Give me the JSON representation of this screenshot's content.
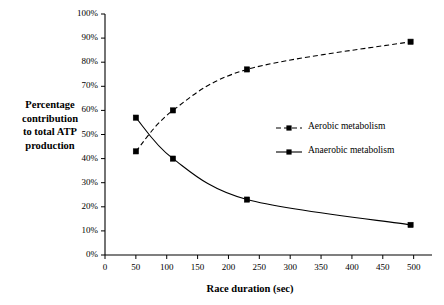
{
  "chart_data": {
    "type": "line",
    "title": "",
    "xlabel": "Race duration (sec)",
    "ylabel": "Percentage contribution to total ATP production",
    "xlim": [
      0,
      520
    ],
    "ylim": [
      0,
      100
    ],
    "grid": false,
    "legend_position": "center-right",
    "x_ticks": [
      "0",
      "50",
      "100",
      "150",
      "200",
      "250",
      "300",
      "350",
      "400",
      "450",
      "500"
    ],
    "x_tick_values": [
      0,
      50,
      100,
      150,
      200,
      250,
      300,
      350,
      400,
      450,
      500
    ],
    "y_ticks": [
      "0%",
      "10%",
      "20%",
      "30%",
      "40%",
      "50%",
      "60%",
      "70%",
      "80%",
      "90%",
      "100%"
    ],
    "y_tick_values": [
      0,
      10,
      20,
      30,
      40,
      50,
      60,
      70,
      80,
      90,
      100
    ],
    "series": [
      {
        "name": "Aerobic metabolism",
        "style": "dashed",
        "marker": "square",
        "color": "#000000",
        "x": [
          50,
          110,
          230,
          495
        ],
        "values": [
          43,
          60,
          77,
          88.5
        ]
      },
      {
        "name": "Anaerobic metabolism",
        "style": "solid",
        "marker": "square",
        "color": "#000000",
        "x": [
          50,
          110,
          230,
          495
        ],
        "values": [
          57,
          40,
          23,
          12.5
        ]
      }
    ]
  },
  "axis": {
    "y_label_lines": [
      "Percentage",
      "contribution",
      "to total ATP",
      "production"
    ],
    "x_title": "Race duration (sec)"
  },
  "legend": {
    "items": [
      {
        "label": "Aerobic metabolism",
        "style": "dashed"
      },
      {
        "label": "Anaerobic metabolism",
        "style": "solid"
      }
    ]
  }
}
